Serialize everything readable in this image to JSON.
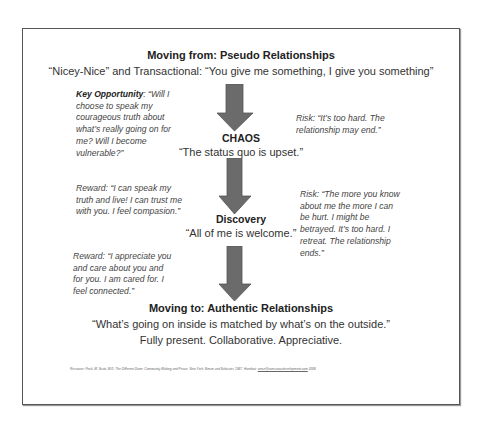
{
  "header": {
    "title": "Moving from:  Pseudo Relationships",
    "subtitle": "“Nicey-Nice” and Transactional:  “You give me something, I give you something”"
  },
  "stages": [
    {
      "label": "CHAOS",
      "quote": "“The status quo is upset.”"
    },
    {
      "label": "Discovery",
      "quote": "“All of me is welcome.”"
    }
  ],
  "left_notes": [
    {
      "label": "Key Opportunity",
      "text": ":  “Will I choose to speak my courageous truth about what’s really going on for me?   Will I become vulnerable?”"
    },
    {
      "label": "",
      "text": "Reward:  “I can speak my truth and live!  I can trust me with you.  I feel compasion.”"
    },
    {
      "label": "",
      "text": "Reward:  “I appreciate you and care about you and for you. I am cared for.  I feel connected.”"
    }
  ],
  "right_notes": [
    {
      "text": "Risk:  “It’s too hard.  The relationship may end.”"
    },
    {
      "text": "Risk:  “The more you know about me the more I can be hurt.  I might be betrayed. It’s too hard.  I retreat. The relationship ends.”"
    }
  ],
  "footer_section": {
    "title": "Moving to:  Authentic Relationships",
    "line1": "“What’s going on inside is matched by what’s on the outside.”",
    "line2": "Fully present.  Collaborative.  Appreciative."
  },
  "resource": {
    "text": "Resource:  Peck, M. Scott, M.D.  The Different Drum:  Community Making and Peace.  New York:  Simon and Schuster, 1987.  Handout: ",
    "link": "vince@consciousdevelopment.com",
    "year": " 2006"
  },
  "colors": {
    "arrow": "#6b6b6b",
    "arrow_edge": "#555555",
    "border": "#555555"
  }
}
